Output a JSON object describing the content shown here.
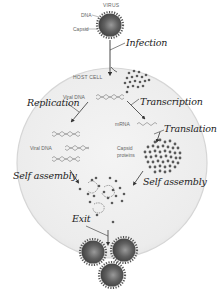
{
  "diagram": {
    "labels": {
      "virus": "VIRUS",
      "dna": "DNA",
      "capsid": "Capsid",
      "host_cell": "HOST CELL",
      "viral_dna_top": "Viral DNA",
      "viral_dna_left": "Viral DNA",
      "mrna": "mRNA",
      "capsid_proteins_1": "Capsid",
      "capsid_proteins_2": "proteins"
    },
    "steps": {
      "infection": "Infection",
      "replication": "Replication",
      "transcription": "Transcription",
      "translation": "Translation",
      "self_assembly_left": "Self assembly",
      "self_assembly_right": "Self assembly",
      "exit": "Exit"
    },
    "colors": {
      "virus_fill": "#555555",
      "cell_fill": "#efefef",
      "cell_border": "#d8d8d8",
      "dot": "#5a5a5a",
      "arrow": "#333333"
    }
  }
}
